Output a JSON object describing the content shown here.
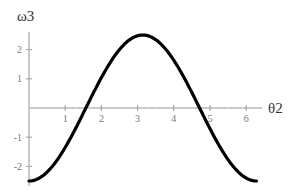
{
  "chart_data": {
    "type": "line",
    "title": "",
    "xlabel": "θ2",
    "ylabel": "ω3",
    "xlim": [
      0,
      6.2832
    ],
    "ylim": [
      -2.5,
      2.5
    ],
    "x_ticks": [
      1,
      2,
      3,
      4,
      5,
      6
    ],
    "y_ticks": [
      -2,
      -1,
      1,
      2
    ],
    "grid": false,
    "legend": null,
    "series": [
      {
        "name": "ω3(θ2)",
        "color": "#000000",
        "x": [
          0,
          0.5,
          1.0,
          1.5,
          1.5708,
          2.0,
          2.5,
          3.0,
          3.1416,
          3.5,
          4.0,
          4.5,
          4.7124,
          5.0,
          5.5,
          6.0,
          6.2832
        ],
        "y": [
          -2.5,
          -2.19,
          -1.35,
          -0.18,
          0.0,
          1.04,
          2.0,
          2.47,
          2.5,
          2.34,
          1.63,
          0.53,
          0.0,
          -0.71,
          -1.77,
          -2.4,
          -2.5
        ]
      }
    ]
  }
}
